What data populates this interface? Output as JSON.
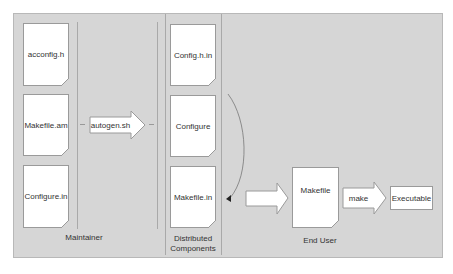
{
  "maintainer": {
    "label": "Maintainer",
    "files": [
      "acconfig.h",
      "Makefile.am",
      "Configure.in"
    ]
  },
  "autogen": {
    "label": "autogen.sh"
  },
  "distributed": {
    "label_line1": "Distributed",
    "label_line2": "Components",
    "files": [
      "Config.h.in",
      "Configure",
      "Makefile.in"
    ]
  },
  "end_user": {
    "label": "End User",
    "makefile": "Makefile",
    "make_label": "make",
    "executable": "Executable"
  },
  "colors": {
    "background": "#d6d6d6",
    "doc_fill": "#ffffff",
    "stroke": "#9a9a9a"
  }
}
